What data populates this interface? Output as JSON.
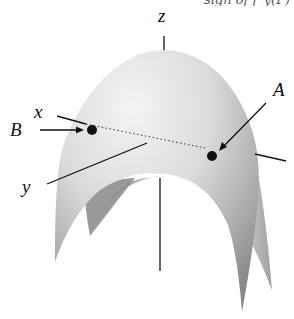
{
  "caption_fragment": "sign of f_y(P)",
  "diagram": {
    "type": "3d-surface",
    "axes": {
      "x_label": "x",
      "y_label": "y",
      "z_label": "z"
    },
    "points": [
      {
        "label": "A"
      },
      {
        "label": "B"
      }
    ],
    "colors": {
      "surface_light": "#f2f2f2",
      "surface_mid": "#c8c8c8",
      "surface_dark": "#8e8e8e",
      "ink": "#111111"
    }
  }
}
